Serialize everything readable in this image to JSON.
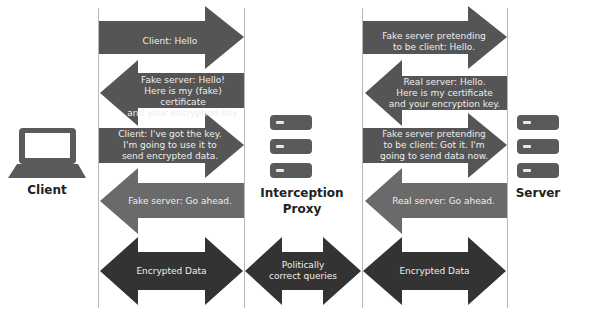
{
  "nodes": {
    "client": {
      "label": "Client",
      "icon": "laptop-icon"
    },
    "proxy": {
      "label": "Interception\nProxy",
      "icon": "server-stack-icon"
    },
    "server": {
      "label": "Server",
      "icon": "server-stack-icon"
    }
  },
  "colors": {
    "arrow_dark": "#525252",
    "arrow_medium": "#696969",
    "arrow_darkest": "#333333",
    "text_on_arrow": "#eeeeee",
    "divider": "#b8b8b8"
  },
  "left_column": {
    "messages": [
      {
        "direction": "right",
        "text": "Client: Hello"
      },
      {
        "direction": "left",
        "text": "Fake server: Hello!\nHere is my (fake) certificate\nand your encryption key."
      },
      {
        "direction": "right",
        "text": "Client: I've got the key.\nI'm going to use it to\nsend encrypted data."
      },
      {
        "direction": "left",
        "text": "Fake server: Go ahead."
      },
      {
        "direction": "both",
        "text": "Encrypted Data"
      }
    ]
  },
  "middle": {
    "messages": [
      {
        "direction": "both",
        "text": "Politically\ncorrect queries"
      }
    ]
  },
  "right_column": {
    "messages": [
      {
        "direction": "right",
        "text": "Fake server pretending\nto be client: Hello."
      },
      {
        "direction": "left",
        "text": "Real server: Hello.\nHere is my certificate\nand your encryption key."
      },
      {
        "direction": "right",
        "text": "Fake server pretending\nto be client: Got it. I'm\ngoing to send data now."
      },
      {
        "direction": "left",
        "text": "Real server: Go ahead."
      },
      {
        "direction": "both",
        "text": "Encrypted Data"
      }
    ]
  }
}
